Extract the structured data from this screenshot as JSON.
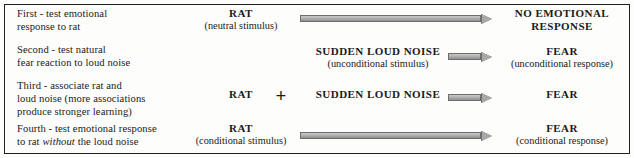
{
  "figure": {
    "border_color": "#231f20",
    "background_color": "#fdfdfb",
    "arrow_fill": "#b5b5b5",
    "arrow_outline": "#6e6e6e",
    "plus_symbol": "+"
  },
  "rows": [
    {
      "description_line1": "First - test emotional",
      "description_line2": "response to rat",
      "stimulus_label": "RAT",
      "stimulus_paren": "(neutral stimulus)",
      "second_label": "",
      "second_paren": "",
      "outcome_label_line1": "NO EMOTIONAL",
      "outcome_label_line2": "RESPONSE",
      "outcome_paren": "",
      "arrow": "long"
    },
    {
      "description_line1": "Second - test natural",
      "description_line2": "fear reaction to loud noise",
      "stimulus_label": "",
      "stimulus_paren": "",
      "second_label": "SUDDEN LOUD NOISE",
      "second_paren": "(unconditional stimulus)",
      "outcome_label_line1": "FEAR",
      "outcome_label_line2": "",
      "outcome_paren": "(unconditional response)",
      "arrow": "short"
    },
    {
      "description_line1": "Third - associate rat and",
      "description_line2": "loud noise (more associations",
      "description_line3": "produce stronger learning)",
      "stimulus_label": "RAT",
      "stimulus_paren": "",
      "second_label": "SUDDEN LOUD NOISE",
      "second_paren": "",
      "outcome_label_line1": "FEAR",
      "outcome_label_line2": "",
      "outcome_paren": "",
      "arrow": "short"
    },
    {
      "description_line1": "Fourth - test emotional response",
      "description_line2_pre": "to rat ",
      "description_line2_italic": "without",
      "description_line2_post": " the loud noise",
      "stimulus_label": "RAT",
      "stimulus_paren": "(conditional stimulus)",
      "second_label": "",
      "second_paren": "",
      "outcome_label_line1": "FEAR",
      "outcome_label_line2": "",
      "outcome_paren": "(conditional response)",
      "arrow": "long"
    }
  ]
}
